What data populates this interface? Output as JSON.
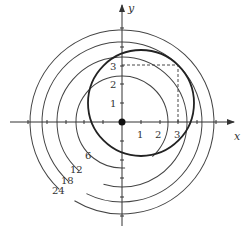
{
  "diagram": {
    "origin_px": [
      122,
      122
    ],
    "scale_px_per_unit": 18.8,
    "axes": {
      "x_label": "x",
      "y_label": "y"
    },
    "x_tick_labels": [
      "1",
      "2",
      "3"
    ],
    "y_tick_labels": [
      "1",
      "2",
      "3"
    ],
    "level_curves": [
      {
        "label": "6",
        "value": 6
      },
      {
        "label": "12",
        "value": 12
      },
      {
        "label": "18",
        "value": 18
      },
      {
        "label": "24",
        "value": 24
      }
    ],
    "constraint_circle": {
      "center": [
        1,
        1
      ],
      "radius": 2.828
    },
    "marked_point": [
      3,
      3
    ],
    "origin_dot": [
      0,
      0
    ]
  }
}
